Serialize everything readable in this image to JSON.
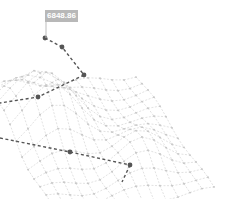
{
  "chart_data": {
    "type": "surface3d",
    "title": "",
    "tooltip": {
      "value": "6848.86"
    },
    "grid": false,
    "axes_visible": false,
    "colors": {
      "mesh": "#cfcfcf",
      "node": "#c4c4c4",
      "highlight": "#555555",
      "tooltip_bg": "#b8b8b8",
      "tooltip_text": "#ffffff"
    },
    "peak_point": {
      "screen": [
        45,
        38
      ],
      "value": 6848.86
    },
    "highlight_paths": [
      [
        [
          45,
          38
        ],
        [
          62,
          47
        ],
        [
          84,
          75
        ]
      ],
      [
        [
          84,
          75
        ],
        [
          38,
          97
        ],
        [
          0,
          103
        ]
      ],
      [
        [
          0,
          138
        ],
        [
          70,
          152
        ],
        [
          130,
          165
        ]
      ],
      [
        [
          130,
          165
        ],
        [
          122,
          182
        ]
      ]
    ],
    "highlight_nodes": [
      [
        45,
        38
      ],
      [
        62,
        47
      ],
      [
        84,
        75
      ],
      [
        38,
        97
      ],
      [
        70,
        152
      ],
      [
        130,
        165
      ]
    ]
  }
}
